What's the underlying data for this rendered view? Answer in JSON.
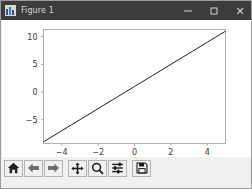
{
  "window": {
    "title": "Figure 1",
    "app_icon": "matplotlib-icon",
    "controls": {
      "minimize": "–",
      "maximize": "□",
      "close": "✕"
    },
    "titlebar_color": "#3c3c3c",
    "background_color": "#f0f0f0"
  },
  "toolbar": {
    "buttons": [
      {
        "name": "home-icon",
        "tooltip": "Reset original view"
      },
      {
        "name": "arrow-left-icon",
        "tooltip": "Back to previous view"
      },
      {
        "name": "arrow-right-icon",
        "tooltip": "Forward to next view"
      },
      {
        "name": "move-icon",
        "tooltip": "Pan axes with left mouse, zoom with right"
      },
      {
        "name": "magnifier-icon",
        "tooltip": "Zoom to rectangle"
      },
      {
        "name": "sliders-icon",
        "tooltip": "Configure subplots"
      },
      {
        "name": "floppy-disk-icon",
        "tooltip": "Save the figure"
      }
    ]
  },
  "status": {
    "coordinates": ""
  },
  "chart_data": {
    "type": "line",
    "title": "",
    "xlabel": "",
    "ylabel": "",
    "xlim": [
      -5.0,
      5.0
    ],
    "ylim": [
      -9.3,
      11.3
    ],
    "xticks": [
      -4,
      -2,
      0,
      2,
      4
    ],
    "xticklabels": [
      "−4",
      "−2",
      "0",
      "2",
      "4"
    ],
    "yticks": [
      -5,
      0,
      5,
      10
    ],
    "yticklabels": [
      "−5",
      "0",
      "5",
      "10"
    ],
    "grid": false,
    "legend": null,
    "line_color": "#1f1f1f",
    "line_width": 1,
    "series": [
      {
        "name": "y = 2x + 1",
        "x": [
          -5,
          -4,
          -3,
          -2,
          -1,
          0,
          1,
          2,
          3,
          4,
          5
        ],
        "y": [
          -9,
          -7,
          -5,
          -3,
          -1,
          1,
          3,
          5,
          7,
          9,
          11
        ]
      }
    ]
  }
}
